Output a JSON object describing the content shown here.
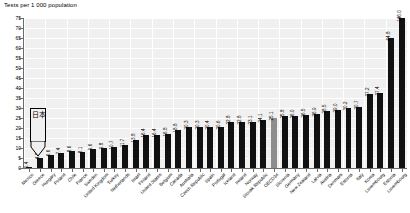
{
  "chart_data": {
    "type": "bar",
    "title": "Tests per 1 000 population",
    "xlabel": "",
    "ylabel": "",
    "ylim": [
      0,
      75
    ],
    "ytick_step": 5,
    "grid": true,
    "legend": null,
    "annotation": {
      "label": "日本",
      "points_to": "Japan",
      "shape": "box-with-down-arrow"
    },
    "yticks": [
      0,
      5,
      10,
      15,
      20,
      25,
      30,
      35,
      40,
      45,
      50,
      55,
      60,
      65,
      70,
      75
    ],
    "categories": [
      "Mexico",
      "Greece",
      "Hungary",
      "Poland",
      "Chile",
      "France",
      "Sweden",
      "United Kingdom",
      "Turkey",
      "Netherlands",
      "Israel",
      "Finland",
      "United States",
      "Belgium",
      "Canada",
      "Australia",
      "Czech Republic",
      "Spain",
      "Portugal",
      "Iceland",
      "Ireland",
      "Norway",
      "Slovak Republic",
      "OECD34",
      "Slovenia",
      "Germany",
      "New Zealand",
      "Latvia",
      "Austria",
      "Denmark",
      "Estonia",
      "Italy",
      "Korea",
      "Luxembourg"
    ],
    "values": [
      0.4,
      4.8,
      6.6,
      7.4,
      8.6,
      8.1,
      9.6,
      9.8,
      10.7,
      11.7,
      13.8,
      16.4,
      16.4,
      16.8,
      18.8,
      20.3,
      20.3,
      20.4,
      20.6,
      22.8,
      22.8,
      23.1,
      24.1,
      25.1,
      25.8,
      26.0,
      26.5,
      26.9,
      28.5,
      29.0,
      30.2,
      30.7,
      37.2,
      37.4
    ],
    "tail_values": [
      64.8,
      146.0
    ],
    "tail_categories": [
      "Estonia2",
      "Luxembourg2"
    ],
    "highlight_index": 23,
    "highlight_color": "#8d8d8d",
    "bar_color": "#111111",
    "plot_background": "#f0f0f0"
  },
  "axis": {
    "y_labels": [
      "75",
      "70",
      "65",
      "60",
      "55",
      "50",
      "45",
      "40",
      "35",
      "30",
      "25",
      "20",
      "15",
      "10",
      "5",
      "0"
    ]
  }
}
